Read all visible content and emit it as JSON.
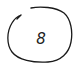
{
  "diagram": {
    "node": {
      "shape": "hand-drawn-circle",
      "label": "8",
      "stroke_color": "#1a1a1a",
      "background": "#ffffff"
    }
  }
}
